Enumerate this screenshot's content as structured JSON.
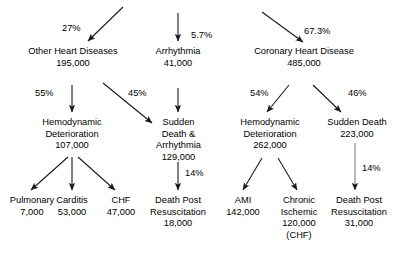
{
  "diagram": {
    "kind": "flowchart",
    "title": "",
    "background_color": "#ffffff",
    "text_color": "#000000",
    "arrow_color": "#1a1a1a",
    "nodes": [
      {
        "id": "other-heart-diseases",
        "label": "Other Heart Diseases",
        "value": "195,000",
        "extra": ""
      },
      {
        "id": "arrhythmia",
        "label": "Arrhythmia",
        "value": "41,000",
        "extra": ""
      },
      {
        "id": "coronary-heart-disease",
        "label": "Coronary Heart Disease",
        "value": "485,000",
        "extra": ""
      },
      {
        "id": "hemodynamic-deterioration-left",
        "label_line1": "Hemodynamic",
        "label_line2": "Deterioration",
        "value": "107,000"
      },
      {
        "id": "sudden-death-arrhythmia",
        "label_line1": "Sudden",
        "label_line2": "Death &",
        "label_line3": "Arrhythmia",
        "value": "129,000"
      },
      {
        "id": "hemodynamic-deterioration-right",
        "label_line1": "Hemodynamic",
        "label_line2": "Deterioration",
        "value": "262,000"
      },
      {
        "id": "sudden-death",
        "label_line1": "Sudden Death",
        "value": "223,000"
      },
      {
        "id": "pulmonary",
        "label": "Pulmonary",
        "value": "7,000"
      },
      {
        "id": "carditis",
        "label": "Carditis",
        "value": "53,000"
      },
      {
        "id": "chf",
        "label": "CHF",
        "value": "47,000"
      },
      {
        "id": "death-post-resuscitation-center",
        "label_line1": "Death Post",
        "label_line2": "Resuscitation",
        "value": "18,000"
      },
      {
        "id": "ami",
        "label": "AMI",
        "value": "142,000"
      },
      {
        "id": "chronic-ischemic",
        "label_line1": "Chronic",
        "label_line2": "Ischemic",
        "value": "120,000",
        "note": "(CHF)"
      },
      {
        "id": "death-post-resuscitation-right",
        "label_line1": "Death Post",
        "label_line2": "Resuscitation",
        "value": "31,000"
      }
    ],
    "edge_labels": {
      "root_to_other": "27%",
      "root_to_arrhythmia": "5.7%",
      "root_to_coronary": "67.3%",
      "other_to_hemo": "55%",
      "other_to_sudden": "45%",
      "sudden_to_death_post": "14%",
      "coronary_to_hemo": "54%",
      "coronary_to_sudden": "46%",
      "sudden_death_to_death_post": "14%"
    }
  }
}
